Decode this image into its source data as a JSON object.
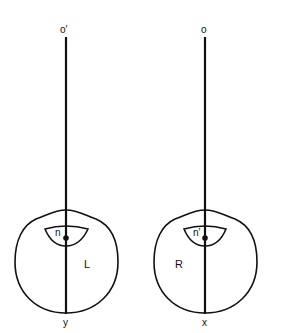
{
  "diagram": {
    "title": "",
    "colors": {
      "stroke": "#111111",
      "background": "#ffffff"
    },
    "left_eye": {
      "top_label": "o′",
      "nodal_label": "n",
      "eye_label": "L",
      "bottom_label": "y"
    },
    "right_eye": {
      "top_label": "o",
      "nodal_label": "n′",
      "eye_label": "R",
      "bottom_label": "x"
    }
  }
}
